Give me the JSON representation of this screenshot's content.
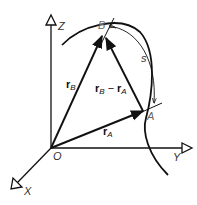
{
  "diagram": {
    "type": "vector-kinematics",
    "axes": {
      "z_label": "Z",
      "y_label": "Y",
      "x_label": "X",
      "origin_label": "O"
    },
    "points": {
      "a_label": "A",
      "b_label": "B"
    },
    "vectors": {
      "r_b": {
        "symbol": "r",
        "subscript": "B"
      },
      "r_a": {
        "symbol": "r",
        "subscript": "A"
      },
      "r_b_minus_r_a": {
        "symbol1": "r",
        "sub1": "B",
        "operator": "−",
        "symbol2": "r",
        "sub2": "A"
      }
    },
    "arc": {
      "label": "s"
    },
    "colors": {
      "line": "#111111",
      "label": "#333333",
      "background": "#ffffff"
    }
  }
}
